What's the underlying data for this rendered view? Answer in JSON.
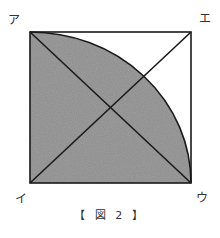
{
  "figure": {
    "caption": "【 図 2 】",
    "vertices": {
      "top_left": "ア",
      "top_right": "エ",
      "bottom_left": "イ",
      "bottom_right": "ウ"
    },
    "colors": {
      "shade": "#8c8c8c",
      "line": "#1a1a1a",
      "background": "#ffffff"
    }
  }
}
